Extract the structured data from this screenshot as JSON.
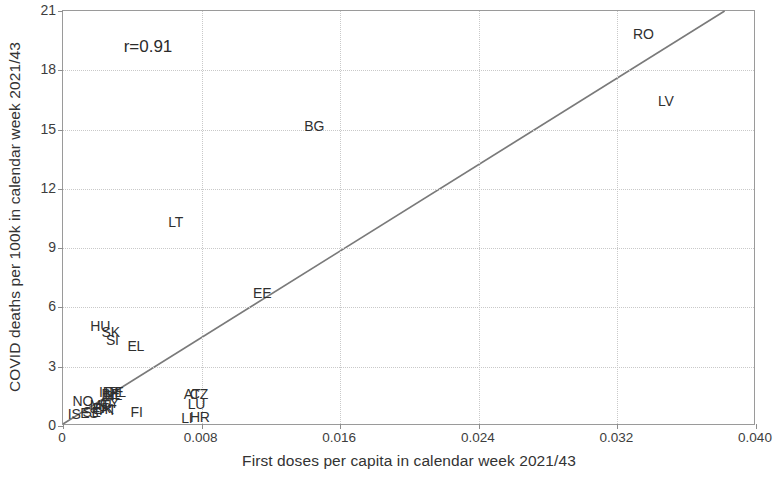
{
  "chart_data": {
    "type": "scatter",
    "title": "",
    "xlabel": "First doses per capita in calendar week 2021/43",
    "ylabel": "COVID deaths per 100k in calendar week 2021/43",
    "xlim": [
      0,
      0.04
    ],
    "ylim": [
      0,
      21
    ],
    "xticks": [
      "0",
      "0.008",
      "0.016",
      "0.024",
      "0.032",
      "0.040"
    ],
    "xtick_values": [
      0,
      0.008,
      0.016,
      0.024,
      0.032,
      0.04
    ],
    "yticks": [
      "0",
      "3",
      "6",
      "9",
      "12",
      "15",
      "18",
      "21"
    ],
    "ytick_values": [
      0,
      3,
      6,
      9,
      12,
      15,
      18,
      21
    ],
    "grid": true,
    "legend": "none",
    "annotation": "r=0.91",
    "annotation_x": 0.0035,
    "annotation_y": 19.7,
    "marker_style": "text-label-only",
    "trendline": {
      "type": "linear",
      "x_start": 0.0,
      "y_start": 0.0,
      "x_end": 0.0383,
      "y_end": 21.0
    },
    "points": [
      {
        "label": "RO",
        "x": 0.0335,
        "y": 19.85
      },
      {
        "label": "LV",
        "x": 0.0348,
        "y": 16.45
      },
      {
        "label": "BG",
        "x": 0.0145,
        "y": 15.2
      },
      {
        "label": "LT",
        "x": 0.0065,
        "y": 10.3
      },
      {
        "label": "EE",
        "x": 0.0115,
        "y": 6.75
      },
      {
        "label": "HU",
        "x": 0.00215,
        "y": 5.05
      },
      {
        "label": "SK",
        "x": 0.00275,
        "y": 4.75
      },
      {
        "label": "SI",
        "x": 0.00285,
        "y": 4.35
      },
      {
        "label": "EL",
        "x": 0.0042,
        "y": 4.05
      },
      {
        "label": "AT",
        "x": 0.00745,
        "y": 1.62
      },
      {
        "label": "CZ",
        "x": 0.00785,
        "y": 1.62
      },
      {
        "label": "LU",
        "x": 0.0077,
        "y": 1.1
      },
      {
        "label": "HR",
        "x": 0.0079,
        "y": 0.45
      },
      {
        "label": "LI",
        "x": 0.00715,
        "y": 0.38
      },
      {
        "label": "IE",
        "x": 0.00245,
        "y": 1.72
      },
      {
        "label": "BE",
        "x": 0.00275,
        "y": 1.62
      },
      {
        "label": "PL",
        "x": 0.00315,
        "y": 1.72
      },
      {
        "label": "DE",
        "x": 0.00295,
        "y": 1.7
      },
      {
        "label": "NL",
        "x": 0.0029,
        "y": 1.55
      },
      {
        "label": "NO",
        "x": 0.00115,
        "y": 1.24
      },
      {
        "label": "IT",
        "x": 0.0026,
        "y": 1.18
      },
      {
        "label": "CY",
        "x": 0.00268,
        "y": 1.15
      },
      {
        "label": "MT",
        "x": 0.00212,
        "y": 1.05
      },
      {
        "label": "FR",
        "x": 0.00225,
        "y": 0.92
      },
      {
        "label": "DK",
        "x": 0.00238,
        "y": 0.88
      },
      {
        "label": "PT",
        "x": 0.00258,
        "y": 0.82
      },
      {
        "label": "SE",
        "x": 0.00165,
        "y": 0.72
      },
      {
        "label": "ES",
        "x": 0.00152,
        "y": 0.68
      },
      {
        "label": "IS",
        "x": 0.00065,
        "y": 0.62
      },
      {
        "label": "FI",
        "x": 0.00425,
        "y": 0.72
      }
    ]
  }
}
